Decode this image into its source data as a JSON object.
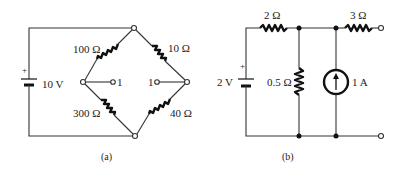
{
  "figure": {
    "panels": [
      {
        "id": "a",
        "caption": "(a)",
        "source": {
          "label": "10 V",
          "polarity_mark": "+"
        },
        "resistors": [
          {
            "position": "top-left",
            "label": "100 Ω"
          },
          {
            "position": "top-right",
            "label": "10 Ω"
          },
          {
            "position": "bottom-left",
            "label": "300 Ω"
          },
          {
            "position": "bottom-right",
            "label": "40 Ω"
          }
        ],
        "terminals": [
          {
            "position": "left-inner",
            "label": "1"
          },
          {
            "position": "right-inner",
            "label": "1"
          }
        ]
      },
      {
        "id": "b",
        "caption": "(b)",
        "source": {
          "label": "2 V",
          "polarity_mark": "+"
        },
        "resistors": [
          {
            "position": "top-series-left",
            "label": "2 Ω"
          },
          {
            "position": "shunt",
            "label": "0.5 Ω"
          },
          {
            "position": "top-series-right",
            "label": "3 Ω"
          }
        ],
        "current_source": {
          "label": "1 A",
          "direction": "up"
        }
      }
    ]
  },
  "colors": {
    "ink": "#222222",
    "background": "#ffffff"
  }
}
